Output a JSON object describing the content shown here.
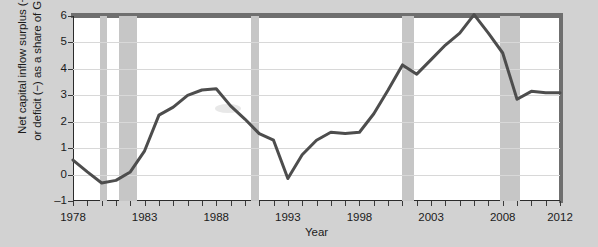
{
  "chart_data": {
    "type": "line",
    "title": "",
    "xlabel": "Year",
    "ylabel": "Net capital inflow surplus (+) or deficit (−) as a share of GDP",
    "ylabel_lines": [
      "Net capital inflow surplus (+)",
      "or deficit (−) as a share of GDP"
    ],
    "xlim": [
      1978,
      2012
    ],
    "ylim": [
      -1,
      6
    ],
    "yticks": [
      -1,
      0,
      1,
      2,
      3,
      4,
      5,
      6
    ],
    "ytick_labels": [
      "–1",
      "0",
      "1",
      "2",
      "3",
      "4",
      "5",
      "6"
    ],
    "xticks": [
      1978,
      1983,
      1988,
      1993,
      1998,
      2003,
      2008,
      2012
    ],
    "xtick_labels": [
      "1978",
      "1983",
      "1988",
      "1993",
      "1998",
      "2003",
      "2008",
      "2012"
    ],
    "xtick_minor_step": 1,
    "grid": "horizontal",
    "legend": "none",
    "line_color": "#4d4d4d",
    "line_width": 3,
    "recession_band_color": "#c6c6c6",
    "plot_background": "#ffffff",
    "figure_background": "#d2d2d2",
    "x": [
      1978,
      1979,
      1980,
      1981,
      1982,
      1983,
      1984,
      1985,
      1986,
      1987,
      1988,
      1989,
      1990,
      1991,
      1992,
      1993,
      1994,
      1995,
      1996,
      1997,
      1998,
      1999,
      2000,
      2001,
      2002,
      2003,
      2004,
      2005,
      2006,
      2007,
      2008,
      2009,
      2010,
      2011,
      2012
    ],
    "values": [
      0.55,
      0.1,
      -0.32,
      -0.22,
      0.1,
      0.9,
      2.25,
      2.55,
      3.0,
      3.2,
      3.25,
      2.6,
      2.1,
      1.55,
      1.3,
      -0.15,
      0.75,
      1.3,
      1.6,
      1.55,
      1.6,
      2.3,
      3.2,
      4.15,
      3.8,
      4.35,
      4.9,
      5.35,
      6.05,
      5.35,
      4.6,
      2.85,
      3.15,
      3.1,
      3.1
    ],
    "recessions": [
      {
        "start": 1979.9,
        "end": 1980.4
      },
      {
        "start": 1981.2,
        "end": 1982.5
      },
      {
        "start": 1990.4,
        "end": 1991.0
      },
      {
        "start": 2001.0,
        "end": 2001.8
      },
      {
        "start": 2007.8,
        "end": 2009.2
      }
    ],
    "series": [
      {
        "name": "Net capital inflow as share of GDP",
        "values": [
          0.55,
          0.1,
          -0.32,
          -0.22,
          0.1,
          0.9,
          2.25,
          2.55,
          3.0,
          3.2,
          3.25,
          2.6,
          2.1,
          1.55,
          1.3,
          -0.15,
          0.75,
          1.3,
          1.6,
          1.55,
          1.6,
          2.3,
          3.2,
          4.15,
          3.8,
          4.35,
          4.9,
          5.35,
          6.05,
          5.35,
          4.6,
          2.85,
          3.15,
          3.1,
          3.1
        ]
      }
    ]
  }
}
